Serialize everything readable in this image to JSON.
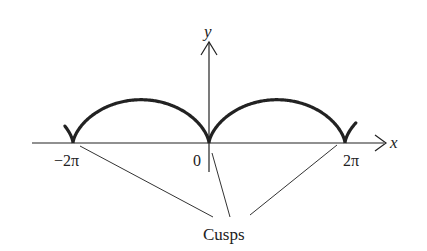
{
  "figure": {
    "axes": {
      "x_label": "x",
      "y_label": "y"
    },
    "tick_labels": {
      "neg_two_pi": "−2π",
      "zero": "0",
      "two_pi": "2π"
    },
    "annotation": {
      "label": "Cusps"
    },
    "curve": {
      "description": "cycloid",
      "cusps_at": [
        "-2π",
        "0",
        "2π"
      ],
      "color": "#222222"
    }
  }
}
